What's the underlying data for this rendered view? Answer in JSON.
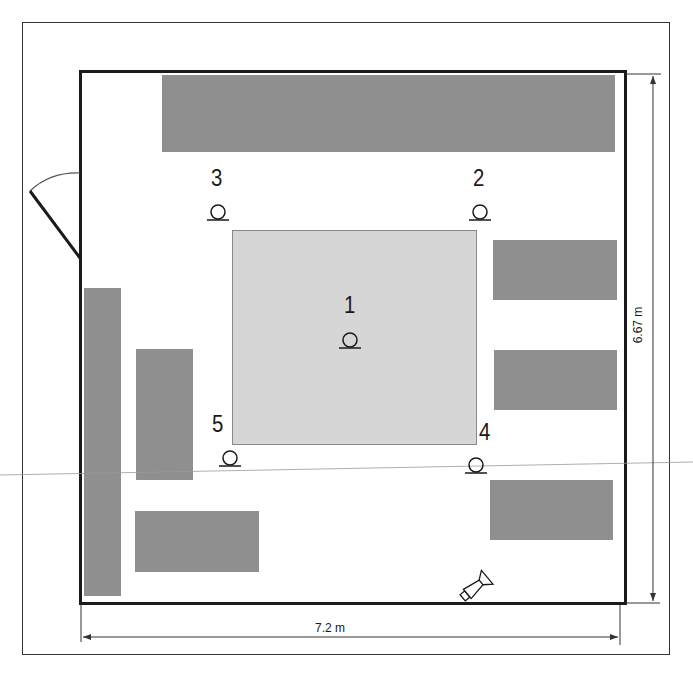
{
  "diagram": {
    "type": "room-floor-plan",
    "dimensions": {
      "width_label": "7.2 m",
      "height_label": "6.67 m"
    },
    "microphones": [
      {
        "id": "1",
        "label": "1",
        "x": 350,
        "y": 340
      },
      {
        "id": "2",
        "label": "2",
        "x": 480,
        "y": 212
      },
      {
        "id": "3",
        "label": "3",
        "x": 218,
        "y": 212
      },
      {
        "id": "4",
        "label": "4",
        "x": 476,
        "y": 465
      },
      {
        "id": "5",
        "label": "5",
        "x": 230,
        "y": 458
      }
    ],
    "furniture": [
      {
        "name": "top-bench",
        "x": 162,
        "y": 75,
        "w": 453,
        "h": 77
      },
      {
        "name": "right-bench-1",
        "x": 493,
        "y": 240,
        "w": 124,
        "h": 60
      },
      {
        "name": "right-bench-2",
        "x": 494,
        "y": 350,
        "w": 123,
        "h": 60
      },
      {
        "name": "right-bench-3",
        "x": 490,
        "y": 480,
        "w": 123,
        "h": 60
      },
      {
        "name": "left-tall-cabinet",
        "x": 84,
        "y": 288,
        "w": 37,
        "h": 308
      },
      {
        "name": "left-mid-table",
        "x": 136,
        "y": 349,
        "w": 57,
        "h": 131
      },
      {
        "name": "left-bottom-table",
        "x": 135,
        "y": 511,
        "w": 124,
        "h": 61
      }
    ],
    "central_area": {
      "x": 232,
      "y": 230,
      "w": 245,
      "h": 215
    },
    "colors": {
      "walls": "#1a1a1a",
      "furniture": "#8f8f8f",
      "central_area": "#d6d6d6",
      "background": "#ffffff"
    }
  }
}
